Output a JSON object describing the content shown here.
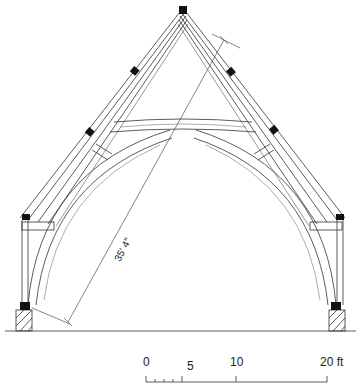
{
  "figure": {
    "dimension_label": "35' 4\"",
    "scale_bar": {
      "ticks": [
        "0",
        "5",
        "10",
        "20 ft"
      ],
      "unit": "ft"
    }
  },
  "colors": {
    "ink": "#222222",
    "background": "#ffffff",
    "joint_block": "#111111"
  }
}
